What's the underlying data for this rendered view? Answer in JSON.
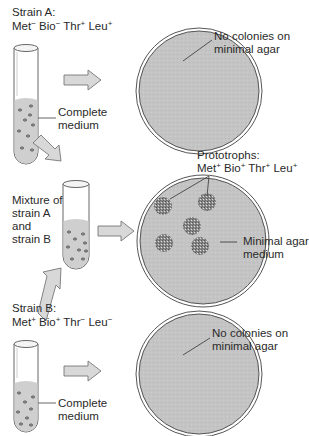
{
  "colors": {
    "agar_fill": "#c4c4c4",
    "plate_rim": "#555555",
    "medium_fill": "#cfcfcf",
    "tube_stroke": "#666666",
    "arrow_fill": "#d8d8d8",
    "arrow_stroke": "#777777",
    "colony": "#777777",
    "text": "#2a2a2a"
  },
  "strain_a": {
    "title": "Strain A:",
    "genotype": [
      {
        "gene": "Met",
        "sign": "−"
      },
      {
        "gene": "Bio",
        "sign": "−"
      },
      {
        "gene": "Thr",
        "sign": "+"
      },
      {
        "gene": "Leu",
        "sign": "+"
      }
    ],
    "tube_label_line1": "Complete",
    "tube_label_line2": "medium",
    "plate_label_line1": "No colonies on",
    "plate_label_line2": "minimal agar"
  },
  "mixture": {
    "label_line1": "Mixture of",
    "label_line2": "strain A",
    "label_line3": "and",
    "label_line4": "strain B",
    "prototroph_title": "Prototrophs:",
    "prototroph_genotype": [
      {
        "gene": "Met",
        "sign": "+"
      },
      {
        "gene": "Bio",
        "sign": "+"
      },
      {
        "gene": "Thr",
        "sign": "+"
      },
      {
        "gene": "Leu",
        "sign": "+"
      }
    ],
    "plate_label_line1": "Minimal agar",
    "plate_label_line2": "medium",
    "colony_count": 5
  },
  "strain_b": {
    "title": "Strain B:",
    "genotype": [
      {
        "gene": "Met",
        "sign": "+"
      },
      {
        "gene": "Bio",
        "sign": "+"
      },
      {
        "gene": "Thr",
        "sign": "−"
      },
      {
        "gene": "Leu",
        "sign": "−"
      }
    ],
    "tube_label_line1": "Complete",
    "tube_label_line2": "medium",
    "plate_label_line1": "No colonies on",
    "plate_label_line2": "minimal agar"
  }
}
